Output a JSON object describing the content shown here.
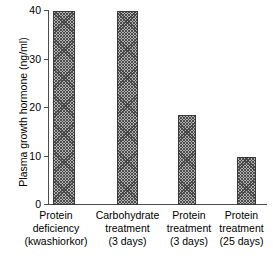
{
  "chart_data": {
    "type": "bar",
    "title": "",
    "xlabel": "",
    "ylabel": "Plasma growth hormone (ng/ml)",
    "ylim": [
      0,
      40
    ],
    "yticks": [
      0,
      10,
      20,
      30,
      40
    ],
    "ytick_labels": [
      "0",
      "10",
      "20",
      "30",
      "40"
    ],
    "grid": false,
    "legend": null,
    "categories": [
      "Protein deficiency (kwashiorkor)",
      "Carbohydrate treatment (3 days)",
      "Protein treatment (3 days)",
      "Protein treatment (25 days)"
    ],
    "category_lines": [
      [
        "Protein",
        "deficiency",
        "(kwashiorkor)"
      ],
      [
        "Carbohydrate",
        "treatment",
        "(3 days)"
      ],
      [
        "Protein",
        "treatment",
        "(3 days)"
      ],
      [
        "Protein",
        "treatment",
        "(25 days)"
      ]
    ],
    "values": [
      40,
      40,
      18.5,
      10
    ],
    "bar_color": "#b3b3b3",
    "bar_edge_color": "#3a3a3a",
    "axis_color": "#4d4d4d"
  }
}
